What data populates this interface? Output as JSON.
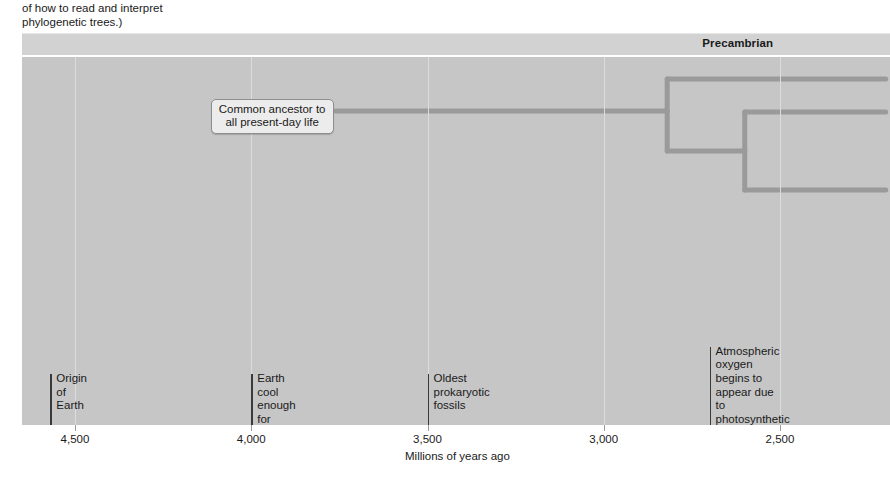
{
  "caption": {
    "text": "of how to read and interpret\nphylogenetic trees.)"
  },
  "era_band": {
    "eras": [
      {
        "label": "Precambrian",
        "center_myr": 2620
      }
    ]
  },
  "chart_data": {
    "type": "timeline",
    "title": "",
    "xlabel": "Millions of years ago",
    "ylabel": "",
    "xlim": [
      4700,
      2200
    ],
    "x_direction": "decreasing",
    "tick_values": [
      4500,
      4000,
      3500,
      3000,
      2500
    ],
    "tick_labels": [
      "4,500",
      "4,000",
      "3,500",
      "3,000",
      "2,500"
    ],
    "grid": true,
    "grid_color": "#dcdcdc",
    "panel_color": "#c6c6c6",
    "events": [
      {
        "label": "Origin of\nEarth",
        "myr": 4570,
        "lines": 2
      },
      {
        "label": "Earth cool enough for\ncrust to solidify",
        "myr": 4000,
        "lines": 2
      },
      {
        "label": "Oldest prokaryotic fossils",
        "myr": 3500,
        "lines": 1
      },
      {
        "label": "Atmospheric oxygen\nbegins to appear due\nto photosynthetic\nprokaryotes",
        "myr": 2700,
        "lines": 4
      }
    ],
    "annotations": [
      {
        "name": "common-ancestor-callout",
        "text": "Common ancestor to\nall present-day life",
        "myr_anchor": 3800
      }
    ],
    "tree": {
      "line_color": "#9a9a9a",
      "line_width_px": 5,
      "trunk": {
        "from_myr": 3760,
        "to_myr": 2820,
        "y_px": 111
      },
      "nodes": [
        {
          "name": "node-1",
          "myr": 2820,
          "top_y_px": 79,
          "bottom_y_px": 151
        },
        {
          "name": "node-2",
          "myr": 2600,
          "top_y_px": 112,
          "bottom_y_px": 190
        }
      ],
      "branches": [
        {
          "name": "branch-1-top",
          "from_myr": 2820,
          "to_myr": 2200,
          "y_px": 79
        },
        {
          "name": "branch-1-bottom",
          "from_myr": 2820,
          "to_myr": 2600,
          "y_px": 151
        },
        {
          "name": "branch-2-top",
          "from_myr": 2600,
          "to_myr": 2200,
          "y_px": 112
        },
        {
          "name": "branch-2-bottom",
          "from_myr": 2600,
          "to_myr": 2200,
          "y_px": 190
        }
      ]
    }
  },
  "colors": {
    "panel": "#c6c6c6",
    "era_band": "#d2d2d2",
    "grid": "#dcdcdc",
    "tree": "#9a9a9a",
    "text": "#1a1a1a",
    "marker": "#3a3a3a"
  }
}
